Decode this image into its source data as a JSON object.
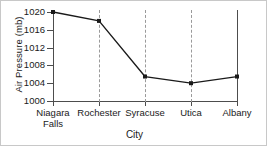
{
  "chart_data": {
    "type": "line",
    "title": "",
    "xlabel": "City",
    "ylabel": "Air Pressure (mb)",
    "categories": [
      "Niagara\nFalls",
      "Rochester",
      "Syracuse",
      "Utica",
      "Albany"
    ],
    "values": [
      1020,
      1018,
      1005.5,
      1004,
      1005.5
    ],
    "series": [
      {
        "name": "Air Pressure",
        "values": [
          1020,
          1018,
          1005.5,
          1004,
          1005.5
        ]
      }
    ],
    "ylim": [
      1000,
      1020
    ],
    "yticks": [
      1000,
      1004,
      1008,
      1012,
      1016,
      1020
    ],
    "ytick_labels": [
      "1000",
      "1004",
      "1008",
      "1012",
      "1016",
      "1020"
    ],
    "grid": "vertical-dashed",
    "legend": "none",
    "marker": "filled-square",
    "line_color": "#1a1a1a",
    "marker_color": "#1a1a1a",
    "grid_color": "#9a9a9a",
    "axis_color": "#4d4d4d",
    "background": "#ffffff"
  }
}
